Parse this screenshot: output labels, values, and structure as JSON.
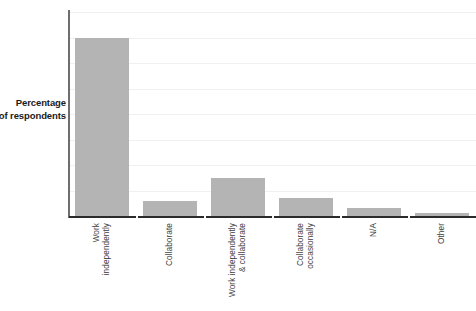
{
  "chart_data": {
    "type": "bar",
    "title": "",
    "xlabel": "",
    "ylabel": "Percentage of respondents",
    "ylabel_line1": "Percentage",
    "ylabel_line2": "of respondents",
    "categories": [
      "Work independently",
      "Collaborate",
      "Work independently & collaborate",
      "Collaborate occasionally",
      "N/A",
      "Other"
    ],
    "category_lines": [
      [
        "Work",
        "independently"
      ],
      [
        "Collaborate",
        ""
      ],
      [
        "Work independently",
        "& collaborate"
      ],
      [
        "Collaborate",
        "occasionally"
      ],
      [
        "N/A",
        ""
      ],
      [
        "Other",
        ""
      ]
    ],
    "values": [
      70,
      6,
      15,
      7,
      3,
      1
    ],
    "ylim": [
      0,
      80
    ],
    "ytick_values": [
      0,
      10,
      20,
      30,
      40,
      50,
      60,
      70,
      80
    ],
    "ytick_labels": [
      "0",
      "10",
      "20",
      "30",
      "40",
      "50",
      "60",
      "70",
      "80"
    ],
    "grid": true,
    "legend": "none",
    "bar_color": "#b4b4b4",
    "gridline_color": "#f0f0f0",
    "axis_color": "#2b2b2b",
    "background_color": "#ffffff"
  }
}
